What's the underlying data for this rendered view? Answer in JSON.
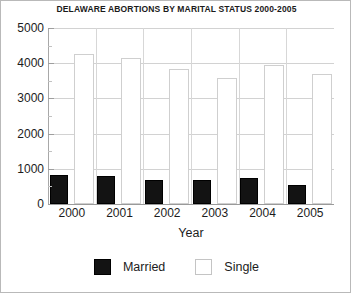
{
  "chart_data": {
    "type": "bar",
    "title": "DELAWARE ABORTIONS BY MARITAL STATUS 2000-2005",
    "xlabel": "Year",
    "ylabel": "",
    "categories": [
      "2000",
      "2001",
      "2002",
      "2003",
      "2004",
      "2005"
    ],
    "series": [
      {
        "name": "Married",
        "color": "#131313",
        "values": [
          830,
          800,
          670,
          670,
          750,
          540
        ]
      },
      {
        "name": "Single",
        "color": "#ffffff",
        "values": [
          4250,
          4150,
          3830,
          3570,
          3950,
          3700
        ]
      }
    ],
    "ylim": [
      0,
      5000
    ],
    "yticks": [
      0,
      1000,
      2000,
      3000,
      4000,
      5000
    ],
    "ytick_labels": [
      "0",
      "1000",
      "2000",
      "3000",
      "4000",
      "5000"
    ],
    "yminor_step": 500,
    "grid": true,
    "legend_position": "bottom"
  }
}
